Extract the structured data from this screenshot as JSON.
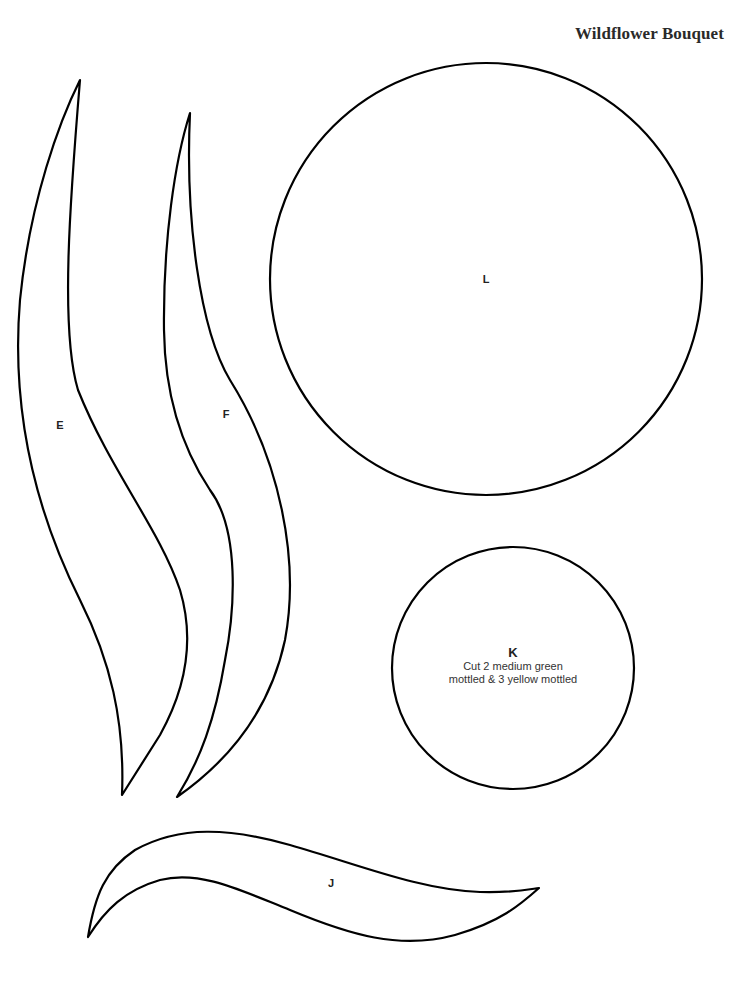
{
  "page": {
    "title": "Wildflower Bouquet",
    "stroke_color": "#000000",
    "background_color": "#ffffff"
  },
  "pieces": {
    "E": {
      "label": "E"
    },
    "F": {
      "label": "F"
    },
    "L": {
      "label": "L"
    },
    "K": {
      "label": "K",
      "instructions": [
        "Cut 2 medium green",
        "mottled & 3 yellow mottled"
      ]
    },
    "J": {
      "label": "J"
    }
  }
}
